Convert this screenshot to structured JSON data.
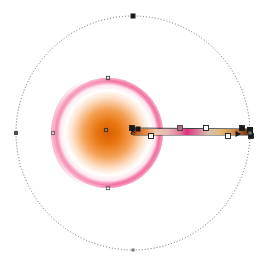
{
  "app": {
    "type": "vector-graphics-editor-canvas",
    "background_color": "#ffffff",
    "canvas_width": 266,
    "canvas_height": 265
  },
  "selection_ellipse": {
    "name": "dotted-selection-circle",
    "center": [
      133,
      133
    ],
    "radius_x": 117,
    "radius_y": 117,
    "stroke_color": "#555555",
    "stroke_dasharray": "1 2",
    "fill": "none",
    "handles": [
      {
        "name": "handle-top",
        "cx": 133,
        "cy": 16,
        "shape": "square",
        "color": "#1a1a1a",
        "size": 5
      },
      {
        "name": "handle-left",
        "cx": 16,
        "cy": 133,
        "shape": "square",
        "color": "#4d4d4d",
        "size": 4
      },
      {
        "name": "handle-bottom",
        "cx": 133,
        "cy": 250,
        "shape": "square",
        "color": "#777777",
        "size": 3
      },
      {
        "name": "handle-right",
        "cx": 250,
        "cy": 133,
        "shape": "square",
        "color": "#777777",
        "size": 3
      }
    ]
  },
  "sphere": {
    "name": "gradient-sphere-object",
    "center": [
      108,
      133
    ],
    "radius": 55,
    "base_color": "#f04a87",
    "shade_color": "#e03a7a",
    "halo_color": "#ffffff",
    "core_color": "#e86a10",
    "core_center": [
      108,
      133
    ],
    "core_radius": 30,
    "edge_nodes": [
      {
        "name": "node-top",
        "cx": 108,
        "cy": 78,
        "color": "#4d4d4d"
      },
      {
        "name": "node-left",
        "cx": 53,
        "cy": 133,
        "color": "#6b6b6b"
      },
      {
        "name": "node-bottom",
        "cx": 108,
        "cy": 188,
        "color": "#6b6b6b"
      },
      {
        "name": "node-center",
        "cx": 106,
        "cy": 130,
        "color": "#3a3a3a"
      }
    ]
  },
  "gradient_tool": {
    "name": "gradient-editor-bar",
    "x_start": 131,
    "x_end": 252,
    "y_upper": 128,
    "y_lower": 135,
    "line_color": "#2a2a2a",
    "focus_marker": {
      "name": "gradient-focus-marker",
      "cx": 133,
      "cy": 131,
      "shape": "x",
      "color": "#1a1a1a"
    },
    "start_square": {
      "name": "gradient-start-square",
      "cx": 138,
      "cy": 129,
      "color": "#1a1a1a",
      "size": 5
    },
    "end_square": {
      "name": "gradient-end-square",
      "cx": 250,
      "cy": 130,
      "color": "#1a1a1a",
      "size": 6
    },
    "triangle_marker": {
      "name": "gradient-angle-triangle",
      "cx": 238,
      "cy": 134,
      "color": "#1a1a1a"
    },
    "stops": [
      {
        "name": "gradient-stop-0",
        "offset": 0.0,
        "color": "#5a2a12",
        "handle": "square-dark",
        "x": 132
      },
      {
        "name": "gradient-stop-1",
        "offset": 0.16,
        "color": "#ffffff",
        "handle": "square-open",
        "x": 151
      },
      {
        "name": "gradient-stop-2",
        "offset": 0.4,
        "color": "#b06a86",
        "handle": "square-solid",
        "x": 180
      },
      {
        "name": "gradient-stop-3",
        "offset": 0.44,
        "color": "#e0307f",
        "handle": "none",
        "x": 185
      },
      {
        "name": "gradient-stop-4",
        "offset": 0.62,
        "color": "#ffffff",
        "handle": "square-open",
        "x": 206
      },
      {
        "name": "gradient-stop-5",
        "offset": 0.8,
        "color": "#e8a050",
        "handle": "square-open",
        "x": 228
      },
      {
        "name": "gradient-stop-6",
        "offset": 0.92,
        "color": "#8a4020",
        "handle": "square-dark",
        "x": 242
      },
      {
        "name": "gradient-stop-7",
        "offset": 1.0,
        "color": "#6b2a10",
        "handle": "square-dark",
        "x": 251
      }
    ],
    "bar_gradient": [
      {
        "offset": 0.0,
        "color": "#5e2a12"
      },
      {
        "offset": 0.04,
        "color": "#c05a18"
      },
      {
        "offset": 0.12,
        "color": "#e88a40"
      },
      {
        "offset": 0.2,
        "color": "#f0c8a8"
      },
      {
        "offset": 0.3,
        "color": "#e8b8b8"
      },
      {
        "offset": 0.4,
        "color": "#e08098"
      },
      {
        "offset": 0.46,
        "color": "#e0307f"
      },
      {
        "offset": 0.55,
        "color": "#d87a9a"
      },
      {
        "offset": 0.64,
        "color": "#d8c0b0"
      },
      {
        "offset": 0.74,
        "color": "#e0b878"
      },
      {
        "offset": 0.84,
        "color": "#d09050"
      },
      {
        "offset": 0.93,
        "color": "#8a4a20"
      },
      {
        "offset": 1.0,
        "color": "#5e2a10"
      }
    ]
  }
}
